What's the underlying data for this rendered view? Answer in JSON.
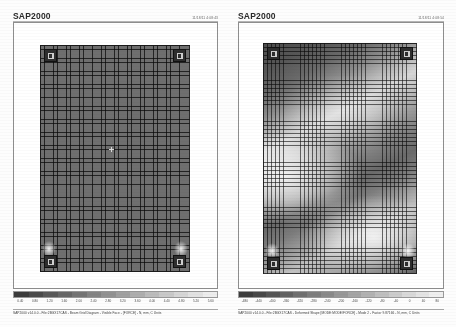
{
  "document": {
    "background_color": "#fdfdfd",
    "ink_color": "#2b2b2b"
  },
  "panels": [
    {
      "id": "left",
      "app_title": "SAP2000",
      "timestamp": "11/18/11 4:08:43",
      "plot_type": "undeformed-mesh",
      "caption": "SAP2000 v14.0.0 - File:2BGX17CAS - Beam Grid Diagram - Visible Face - [FORCE] - N, mm, C Units",
      "supports": [
        {
          "name": "support-top-left"
        },
        {
          "name": "support-top-right"
        },
        {
          "name": "support-bottom-left"
        },
        {
          "name": "support-bottom-right"
        }
      ],
      "legend": {
        "ticks": [
          "0.40",
          "0.80",
          "1.20",
          "1.60",
          "2.00",
          "2.40",
          "2.80",
          "3.20",
          "3.60",
          "4.00",
          "4.40",
          "4.80",
          "5.20",
          "5.60"
        ],
        "swatches": [
          "#3c3c3c",
          "#4a4a4a",
          "#595959",
          "#676767",
          "#757575",
          "#848484",
          "#929292",
          "#a0a0a0",
          "#aeaeae",
          "#bcbcbc",
          "#c9c9c9",
          "#d6d6d6",
          "#e2e2e2",
          "#ededed"
        ]
      }
    },
    {
      "id": "right",
      "app_title": "SAP2000",
      "timestamp": "11/18/11 4:08:54",
      "plot_type": "mode-shape-contour",
      "caption": "SAP2000 v14.0.0 - File:2BGX17CAS - Deformed Shape [MODE:MODE/FORCE] - Mode 2 - Factor 9.87166 - N, mm, C Units",
      "supports": [
        {
          "name": "support-top-left"
        },
        {
          "name": "support-top-right"
        },
        {
          "name": "support-bottom-left"
        },
        {
          "name": "support-bottom-right"
        }
      ],
      "legend": {
        "ticks": [
          "-480",
          "-440",
          "-400",
          "-360",
          "-320",
          "-280",
          "-240",
          "-200",
          "-160",
          "-120",
          "-80",
          "-40",
          "0",
          "40",
          "80"
        ],
        "swatches": [
          "#3c3c3c",
          "#484848",
          "#555555",
          "#626262",
          "#707070",
          "#7d7d7d",
          "#8a8a8a",
          "#989898",
          "#a5a5a5",
          "#b2b2b2",
          "#bfbfbf",
          "#cccccc",
          "#d9d9d9",
          "#e4e4e4",
          "#efefef"
        ]
      }
    }
  ]
}
